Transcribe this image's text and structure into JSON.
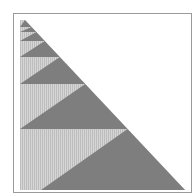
{
  "figure": {
    "colors": {
      "background": "#ffffff",
      "frame": "#9a9a9a",
      "dark": "#7e7e7e",
      "light": "#d6d6d6",
      "hatch": "#bdbdbd"
    },
    "geometry": {
      "left_x": 20,
      "apex": [
        25,
        20
      ],
      "hyp_bottom": [
        185,
        190
      ],
      "band_boundaries_y": [
        20,
        27,
        32,
        41,
        57,
        84,
        129,
        190
      ],
      "bottom_band_dark_left_x": 41
    }
  }
}
